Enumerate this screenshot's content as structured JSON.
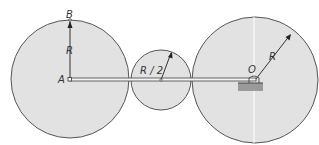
{
  "diagram": {
    "labels": {
      "B": "B",
      "A": "A",
      "O": "O",
      "R_left": "R",
      "R_half": "R / 2",
      "R_right": "R"
    },
    "colors": {
      "fill": "#e2e2e2",
      "stroke": "#555555",
      "ground": "#9a9a9a"
    },
    "circles": [
      {
        "name": "left-disk",
        "cx": 70,
        "cy": 79,
        "r": 59
      },
      {
        "name": "middle-disk",
        "cx": 161,
        "cy": 80,
        "r": 30
      },
      {
        "name": "right-disk",
        "cx": 255,
        "cy": 80,
        "r": 63
      }
    ]
  }
}
